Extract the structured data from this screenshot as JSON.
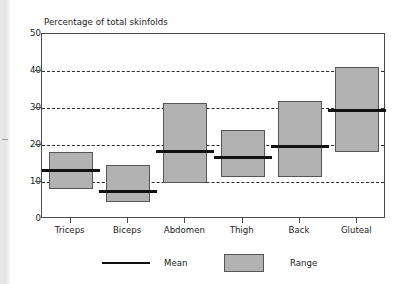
{
  "chart_data": {
    "type": "bar",
    "title": "Percentage of total skinfolds",
    "xlabel": "",
    "ylabel": "",
    "ylim": [
      0,
      50
    ],
    "yticks": [
      0,
      10,
      20,
      30,
      40,
      50
    ],
    "ytick_labels": [
      "0",
      "10",
      "20",
      "30",
      "40",
      "50"
    ],
    "gridlines": [
      10,
      20,
      30,
      40
    ],
    "grid": true,
    "grid_style": "dashed-horizontal",
    "legend_position": "bottom-center",
    "categories": [
      "Triceps",
      "Biceps",
      "Abdomen",
      "Thigh",
      "Back",
      "Gluteal"
    ],
    "series": [
      {
        "name": "Range",
        "type": "range-box",
        "low": [
          8.0,
          4.7,
          9.8,
          11.3,
          11.4,
          18.0
        ],
        "high": [
          18.0,
          14.7,
          31.3,
          24.0,
          32.0,
          41.0
        ]
      },
      {
        "name": "Mean",
        "type": "line-marker",
        "values": [
          13.0,
          7.5,
          18.3,
          16.5,
          19.5,
          29.2
        ]
      }
    ],
    "colors": {
      "range_fill": "#b2b2b2",
      "range_border": "#555555",
      "mean_line": "#111111",
      "axis": "#4a4a4a",
      "grid": "#2b2b2b",
      "background": "#ffffff",
      "text": "#1a1a1a"
    }
  },
  "legend": {
    "items": [
      {
        "label": "Mean",
        "swatch": "line"
      },
      {
        "label": "Range",
        "swatch": "box"
      }
    ]
  }
}
